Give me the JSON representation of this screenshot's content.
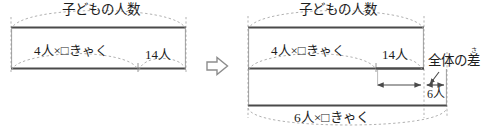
{
  "figure": {
    "type": "tape-diagram-pair",
    "transition_icon": "right-arrow-icon",
    "colors": {
      "line": "#4a4a4a",
      "dashed": "#9a9a9a",
      "text": "#1d1d1d",
      "background": "#ffffff"
    },
    "left_diagram": {
      "name": "before-diagram",
      "top_label": "子どもの人数",
      "segment_main": "4人×□きゃく",
      "segment_remainder": "14人"
    },
    "right_diagram": {
      "name": "after-diagram",
      "top_label": "子どもの人数",
      "upper_segment_main": "4人×□きゃく",
      "upper_segment_remainder": "14人",
      "difference_label_base": "全体の",
      "difference_label_kanji": "差",
      "difference_label_ruby": "さ",
      "difference_label_full": "全体の差",
      "overhang_label": "6人",
      "bottom_label": "6人×□きゃく"
    }
  }
}
